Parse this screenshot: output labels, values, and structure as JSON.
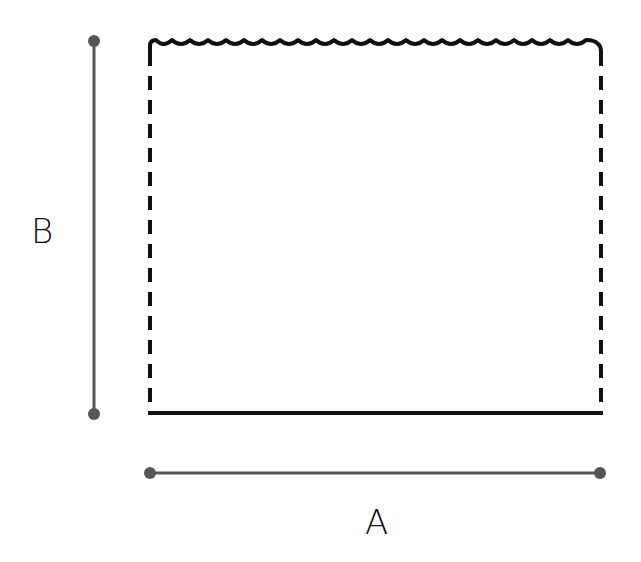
{
  "diagram": {
    "title": "",
    "labels": {
      "width": "A",
      "height": "B"
    },
    "shape": {
      "type": "rectangle",
      "top_edge": "scalloped",
      "side_edges": "dashed",
      "bottom_edge": "solid",
      "scallop_count": 20
    },
    "colors": {
      "outline": "#111111",
      "dimension_line": "#555555",
      "background": "#ffffff"
    }
  }
}
